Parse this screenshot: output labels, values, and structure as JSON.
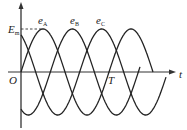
{
  "diagram": {
    "type": "three-phase AC waveform",
    "axes": {
      "x_label": "t",
      "origin_label": "O",
      "period_label": "T",
      "amplitude_label": "E",
      "amplitude_subscript": "m"
    },
    "curves": [
      {
        "name": "e",
        "subscript": "A",
        "phase_deg": 0
      },
      {
        "name": "e",
        "subscript": "B",
        "phase_deg": -120
      },
      {
        "name": "e",
        "subscript": "C",
        "phase_deg": -240
      }
    ],
    "colors": {
      "stroke": "#222222",
      "background": "#ffffff"
    }
  }
}
